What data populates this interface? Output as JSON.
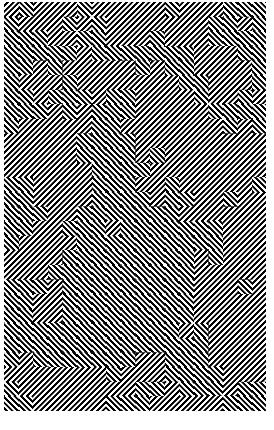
{
  "canvas": {
    "width": 274,
    "height": 430,
    "background_color": "#ffffff",
    "title": "Truchet Labyrinth Pattern"
  },
  "artwork": {
    "name": "diagonal-stripe-truchet-maze",
    "description": "Optical-illusion labyrinth formed by a grid of square tiles, each filled with parallel diagonal stripes angled at either plus or minus forty-five degrees. Opposite-facing neighbours meet to form chevrons and nested concentric corners.",
    "alt_text": "Black and white maze-like optical pattern of fine diagonal stripes forming nested chevrons",
    "foreground_color": "#000000",
    "background_color": "#ffffff"
  },
  "pattern": {
    "type": "truchet-diagonal-stripes",
    "origin_x": 4,
    "origin_y": 2,
    "region_width": 262,
    "region_height": 409,
    "tile_size": 14.6,
    "stripe_period": 4.0,
    "stripe_duty": 0.5,
    "stripe_angle_a": 45,
    "stripe_angle_b": -45,
    "supersample": 3,
    "rng_seed": 20240617,
    "bias_negative_slope": 0.52,
    "grid_columns": 18,
    "grid_rows": 28,
    "margins": {
      "top": 2,
      "right": 8,
      "bottom": 19,
      "left": 4
    }
  },
  "chart_data": {
    "type": "heatmap",
    "xlabel": "tile column",
    "ylabel": "tile row",
    "categories": [
      "slope-down (-45deg)",
      "slope-up (+45deg)"
    ],
    "values": [
      0,
      1
    ],
    "grid": false,
    "legend": "none"
  }
}
